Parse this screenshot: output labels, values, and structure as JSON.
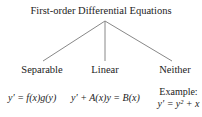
{
  "diagram": {
    "root": "First-order Differential Equations",
    "branches": [
      {
        "label": "Separable",
        "equation": "y′ = f(x)g(y)"
      },
      {
        "label": "Linear",
        "equation": "y′ + A(x)y = B(x)"
      },
      {
        "label": "Neither",
        "example_label": "Example:",
        "equation": "y′ = y² + x"
      }
    ],
    "line_color": "#888888"
  }
}
